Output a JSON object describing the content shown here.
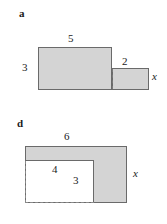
{
  "figure": {
    "type": "geometry-diagram",
    "background_color": "#ffffff",
    "fill_color": "#d4d4d4",
    "stroke_color": "#6a6a6a",
    "text_color": "#1b1b1b"
  },
  "panels": [
    {
      "letter": "a",
      "shape": "stepped-rectangle",
      "labels": {
        "top": "5",
        "left": "3",
        "step_top": "2",
        "right_variable": "x"
      }
    },
    {
      "letter": "d",
      "shape": "L-shape",
      "labels": {
        "top": "6",
        "inner_horizontal": "4",
        "inner_vertical": "3",
        "right_variable": "x"
      }
    }
  ]
}
